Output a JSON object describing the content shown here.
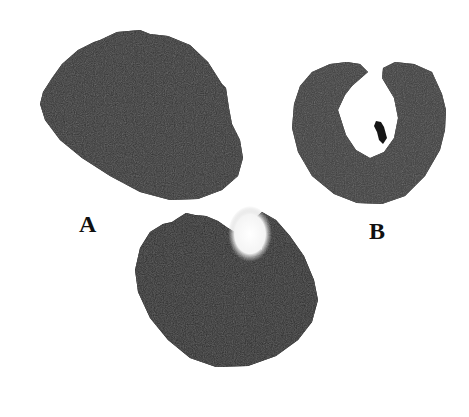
{
  "figure": {
    "panels": [
      {
        "label": "A",
        "description": "solid dark irregular rounded specimen"
      },
      {
        "label": "B",
        "description": "dark ring-shaped specimen with central opening and small dark fragment"
      },
      {
        "label": "",
        "description": "dark rounded specimen with pale notch at top"
      }
    ],
    "colors": {
      "specimen": "#2e2e2e",
      "background": "#ffffff"
    }
  }
}
